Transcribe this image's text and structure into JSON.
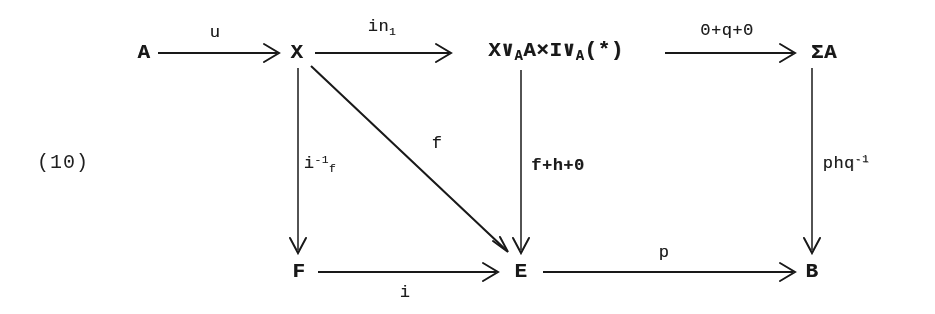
{
  "figure": {
    "equation_number": "(10)",
    "type": "commutative-diagram",
    "caption": ""
  },
  "objects": {
    "a": "A",
    "x": "X",
    "middle": {
      "pre": "X∨",
      "sub1": "A",
      "mid": "A×I∨",
      "sub2": "A",
      "post": "(*)"
    },
    "sigma_a": "ΣA",
    "f_obj": "F",
    "e_obj": "E",
    "b_obj": "B"
  },
  "arrow_labels": {
    "u": "u",
    "in1_base": "in",
    "in1_sub": "1",
    "zero_q_zero": "0+q+0",
    "i_inv_base": "i",
    "i_inv_sup": "-1",
    "i_inv_sub": "f",
    "diag_f": "f",
    "f_h_zero": "f+h+0",
    "phq_base": "phq",
    "phq_sup": "-1",
    "i": "i",
    "p": "p"
  },
  "colors": {
    "ink": "#1d1d1d",
    "paper": "#fefefe"
  }
}
